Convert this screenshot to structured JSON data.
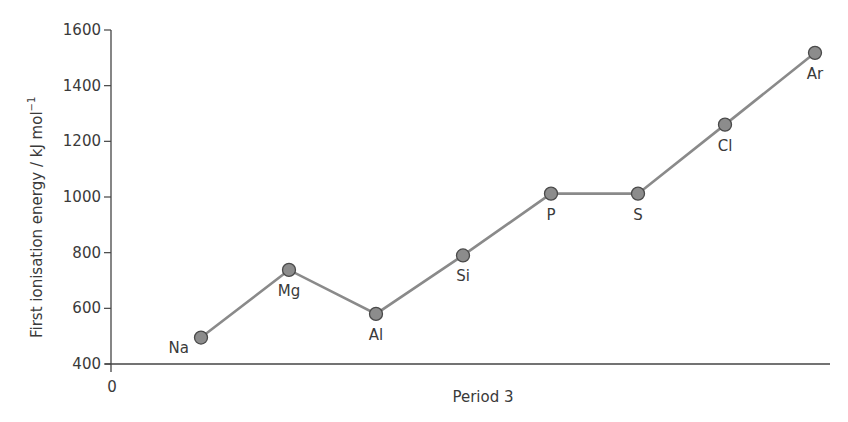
{
  "chart_data": {
    "type": "line",
    "title": "",
    "xlabel": "Period 3",
    "ylabel": "First ionisation energy / kJ mol",
    "ylabel_superscript": "−1",
    "x_origin_label": "0",
    "categories": [
      "Na",
      "Mg",
      "Al",
      "Si",
      "P",
      "S",
      "Cl",
      "Ar"
    ],
    "values": [
      495,
      738,
      580,
      790,
      1012,
      1012,
      1260,
      1518
    ],
    "ylim": [
      400,
      1600
    ],
    "yticks": [
      400,
      600,
      800,
      1000,
      1200,
      1400,
      1600
    ],
    "grid": false,
    "legend": null,
    "label_positions": [
      "left",
      "below",
      "below",
      "below",
      "below",
      "below",
      "below",
      "below"
    ],
    "colors": {
      "line": "#8a8a8a",
      "marker_fill": "#8c8c8c",
      "marker_edge": "#4a4a4a",
      "axis": "#444444"
    }
  }
}
